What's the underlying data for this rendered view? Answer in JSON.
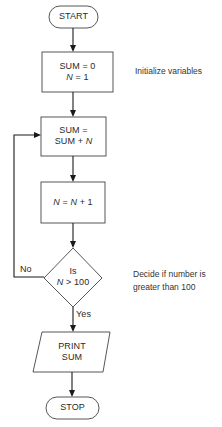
{
  "diagram": {
    "type": "flowchart",
    "colors": {
      "background": "#ffffff",
      "stroke": "#444444",
      "text": "#2a2a2a"
    },
    "nodes": {
      "start": {
        "shape": "terminal",
        "label": "START"
      },
      "init": {
        "shape": "process",
        "line1": "SUM = 0",
        "line2_var": "N",
        "line2_rest": " = 1"
      },
      "sum": {
        "shape": "process",
        "line1": "SUM =",
        "line2_prefix": "SUM + ",
        "line2_var": "N"
      },
      "increment": {
        "shape": "process",
        "var1": "N",
        "mid": " = ",
        "var2": "N",
        "rest": " + 1"
      },
      "decision": {
        "shape": "decision",
        "line1": "Is",
        "line2_var": "N",
        "line2_rest": " > 100"
      },
      "print": {
        "shape": "io",
        "line1": "PRINT",
        "line2": "SUM"
      },
      "stop": {
        "shape": "terminal",
        "label": "STOP"
      }
    },
    "edges": {
      "no_label": "No",
      "yes_label": "Yes"
    },
    "annotations": {
      "init_note": "Initialize variables",
      "decision_note_line1": "Decide if number is",
      "decision_note_line2": "greater than 100"
    }
  }
}
